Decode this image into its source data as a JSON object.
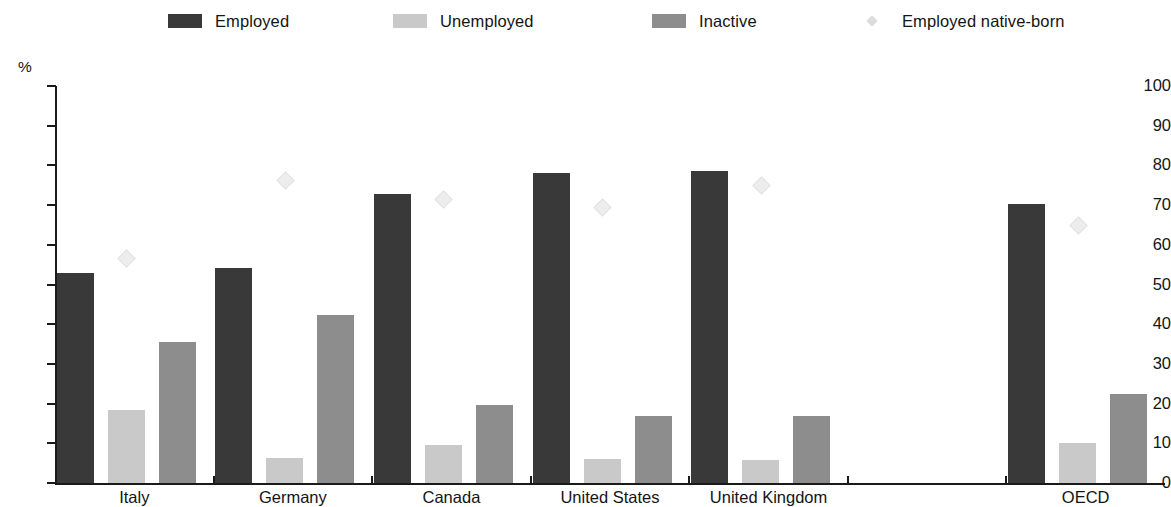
{
  "legend": {
    "items": [
      {
        "key": "employed",
        "label": "Employed",
        "color": "#393939",
        "marker": "square"
      },
      {
        "key": "unemployed",
        "label": "Unemployed",
        "color": "#c9c9c9",
        "marker": "square"
      },
      {
        "key": "inactive",
        "label": "Inactive",
        "color": "#8d8d8d",
        "marker": "square"
      },
      {
        "key": "native_born",
        "label": "Employed native-born",
        "color": "#dcdcdc",
        "marker": "diamond"
      }
    ]
  },
  "axis": {
    "y_unit_label": "%",
    "y_ticks": [
      "100",
      "90",
      "80",
      "70",
      "60",
      "50",
      "40",
      "30",
      "20",
      "10",
      "0"
    ]
  },
  "categories": {
    "labels": [
      "Italy",
      "Germany",
      "Canada",
      "United States",
      "United Kingdom",
      "",
      "OECD"
    ]
  },
  "chart_data": {
    "type": "bar",
    "title": "",
    "subtitle": "",
    "xlabel": "",
    "ylabel": "%",
    "ylim": [
      0,
      100
    ],
    "ytick_step": 10,
    "grid": false,
    "legend_position": "top",
    "categories": [
      "Italy",
      "Germany",
      "Canada",
      "United States",
      "United Kingdom",
      "",
      "OECD"
    ],
    "series": [
      {
        "name": "Employed",
        "color": "#393939",
        "values": [
          52.8,
          54.1,
          72.9,
          78.0,
          78.7,
          null,
          70.3
        ]
      },
      {
        "name": "Unemployed",
        "color": "#c9c9c9",
        "values": [
          18.3,
          6.2,
          9.7,
          6.0,
          5.7,
          null,
          10.2
        ]
      },
      {
        "name": "Inactive",
        "color": "#8d8d8d",
        "values": [
          35.4,
          42.3,
          19.6,
          17.0,
          16.9,
          null,
          22.4
        ]
      },
      {
        "name": "Employed native-born",
        "color": "#dcdcdc",
        "type": "marker",
        "marker": "diamond",
        "values": [
          56.6,
          76.2,
          71.6,
          69.5,
          75.1,
          null,
          65.1
        ]
      }
    ]
  }
}
